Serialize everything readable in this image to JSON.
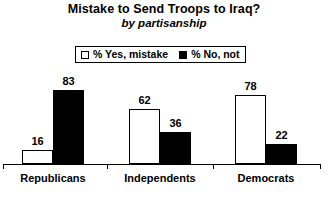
{
  "chart_data": {
    "type": "bar",
    "title": "Mistake to Send Troops to Iraq?",
    "subtitle": "by partisanship",
    "xlabel": "",
    "ylabel": "",
    "ylim": [
      0,
      100
    ],
    "grid": false,
    "legend_position": "top-center",
    "categories": [
      "Republicans",
      "Independents",
      "Democrats"
    ],
    "series": [
      {
        "name": "% Yes, mistake",
        "style": "open",
        "color": "#ffffff",
        "border": "#000000",
        "values": [
          16,
          62,
          78
        ]
      },
      {
        "name": "% No, not",
        "style": "filled",
        "color": "#000000",
        "border": "#000000",
        "values": [
          83,
          36,
          22
        ]
      }
    ]
  },
  "legend": {
    "items": [
      {
        "label": "% Yes, mistake",
        "swatch": "open-square-swatch"
      },
      {
        "label": "% No, not",
        "swatch": "filled-square-swatch"
      }
    ]
  },
  "axis": {
    "ticks": [
      "",
      "",
      "",
      ""
    ]
  }
}
